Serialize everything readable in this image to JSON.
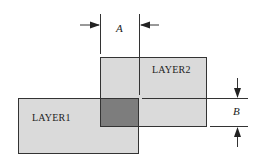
{
  "diagram": {
    "layers": [
      {
        "id": "layer1",
        "label": "LAYER1",
        "fill": "#d9d9d9"
      },
      {
        "id": "layer2",
        "label": "LAYER2",
        "fill": "#d9d9d9"
      }
    ],
    "overlap_fill": "#7a7a7a",
    "dimensions": [
      {
        "id": "A",
        "label": "A",
        "orientation": "horizontal"
      },
      {
        "id": "B",
        "label": "B",
        "orientation": "vertical"
      }
    ]
  }
}
